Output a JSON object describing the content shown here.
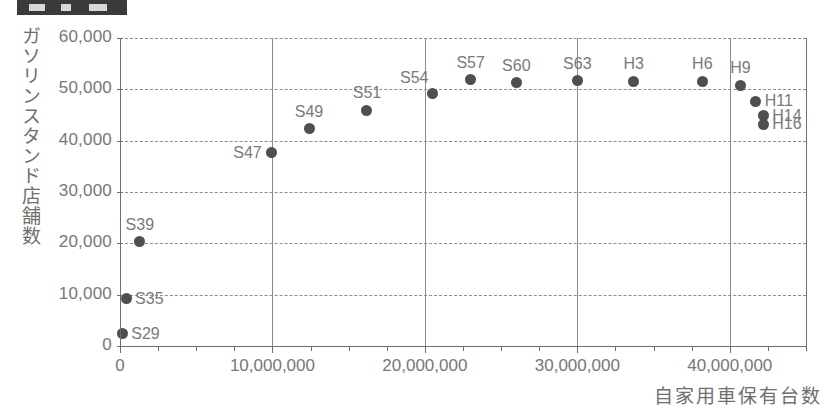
{
  "title_bar": {
    "redacted": true,
    "label": ""
  },
  "chart_data": {
    "type": "scatter",
    "title": "",
    "xlabel": "自家用車保有台数",
    "ylabel": "ガソリンスタンド店舗数",
    "xlim": [
      0,
      45000000
    ],
    "ylim": [
      0,
      60000
    ],
    "grid": "horizontal-dashed-plus-vertical-major",
    "legend": "none",
    "x_ticks": [
      0,
      10000000,
      20000000,
      30000000,
      40000000
    ],
    "x_tick_labels": [
      "0",
      "10,000,000",
      "20,000,000",
      "30,000,000",
      "40,000,000"
    ],
    "x_minor_tick_step": 2500000,
    "y_ticks": [
      0,
      10000,
      20000,
      30000,
      40000,
      50000,
      60000
    ],
    "y_tick_labels": [
      "0",
      "10,000",
      "20,000",
      "30,000",
      "40,000",
      "50,000",
      "60,000"
    ],
    "point_color": "#4f4f4f",
    "points": [
      {
        "label": "S29",
        "x": 150000,
        "y": 2400,
        "label_pos": "right"
      },
      {
        "label": "S35",
        "x": 400000,
        "y": 9200,
        "label_pos": "right"
      },
      {
        "label": "S39",
        "x": 1300000,
        "y": 20300,
        "label_pos": "above"
      },
      {
        "label": "S47",
        "x": 9950000,
        "y": 37600,
        "label_pos": "left"
      },
      {
        "label": "S49",
        "x": 12400000,
        "y": 42300,
        "label_pos": "above"
      },
      {
        "label": "S51",
        "x": 16200000,
        "y": 45900,
        "label_pos": "above"
      },
      {
        "label": "S54",
        "x": 20500000,
        "y": 49200,
        "label_pos": "above-left"
      },
      {
        "label": "S57",
        "x": 23000000,
        "y": 51900,
        "label_pos": "above"
      },
      {
        "label": "S60",
        "x": 26000000,
        "y": 51300,
        "label_pos": "above"
      },
      {
        "label": "S63",
        "x": 30000000,
        "y": 51700,
        "label_pos": "above"
      },
      {
        "label": "H3",
        "x": 33700000,
        "y": 51600,
        "label_pos": "above"
      },
      {
        "label": "H6",
        "x": 38200000,
        "y": 51600,
        "label_pos": "above"
      },
      {
        "label": "H9",
        "x": 40700000,
        "y": 50800,
        "label_pos": "above"
      },
      {
        "label": "H11",
        "x": 41700000,
        "y": 47700,
        "label_pos": "right"
      },
      {
        "label": "H14",
        "x": 42200000,
        "y": 44900,
        "label_pos": "right"
      },
      {
        "label": "H16",
        "x": 42200000,
        "y": 43200,
        "label_pos": "right"
      }
    ]
  }
}
